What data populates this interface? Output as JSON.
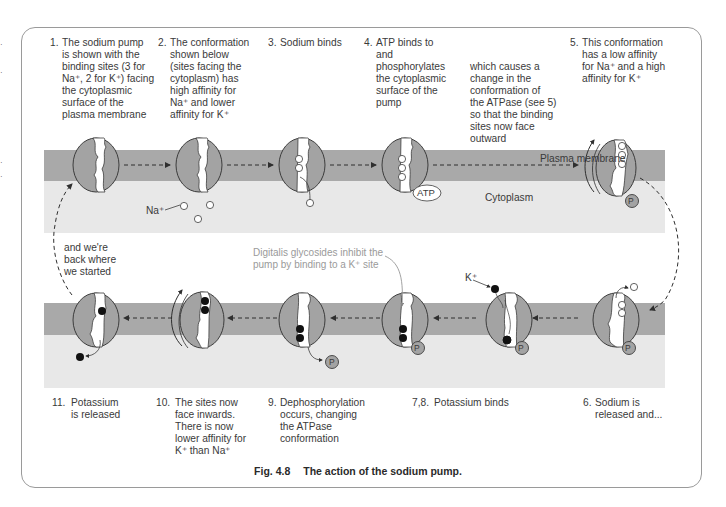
{
  "figure": {
    "caption_number": "Fig. 4.8",
    "caption_title": "The action of the sodium pump.",
    "regions": {
      "membrane_label": "Plasma membrane",
      "cytoplasm_label": "Cytoplasm"
    },
    "ion_labels": {
      "sodium": "Na⁺",
      "potassium": "K⁺"
    },
    "molecule_labels": {
      "atp": "ATP",
      "phosphate": "P"
    },
    "steps_top": [
      {
        "number": "1.",
        "text": "The sodium pump\nis shown with the\nbinding sites (3 for\nNa⁺, 2 for K⁺) facing\nthe cytoplasmic\nsurface of the\nplasma membrane"
      },
      {
        "number": "2.",
        "text": "The conformation\nshown below\n(sites facing the\ncytoplasm) has\nhigh affinity for\nNa⁺ and lower\naffinity for K⁺"
      },
      {
        "number": "3.",
        "text": "Sodium binds"
      },
      {
        "number": "4.",
        "text": "ATP binds to\nand\nphosphorylates\nthe cytoplasmic\nsurface of the\npump"
      },
      {
        "number": "",
        "text": "which causes a\nchange in the\nconformation of\nthe ATPase (see 5)\nso that the binding\nsites now face\noutward"
      },
      {
        "number": "5.",
        "text": "This conformation\nhas a low affinity\nfor Na⁺ and a high\naffinity for K⁺"
      }
    ],
    "steps_bottom": [
      {
        "number": "11.",
        "text": "Potassium\nis released"
      },
      {
        "number": "10.",
        "text": "The sites now\nface inwards.\nThere is now\nlower affinity for\nK⁺ than Na⁺"
      },
      {
        "number": "9.",
        "text": "Dephosphorylation\noccurs, changing\nthe ATPase\nconformation"
      },
      {
        "number": "7,8.",
        "text": "Potassium binds"
      },
      {
        "number": "6.",
        "text": "Sodium is\nreleased and..."
      }
    ],
    "loop_back_note": "and we're\nback where\nwe started",
    "digitalis_note": "Digitalis glycosides inhibit the\npump by binding to a K⁺ site",
    "colors": {
      "membrane": "#a9a9a9",
      "cytoplasm": "#e8e8e8",
      "pump_fill": "#a3a3a3",
      "pump_stroke": "#3c3c3c",
      "note_text": "#9a9a9a",
      "text": "#3a3a3a"
    }
  }
}
